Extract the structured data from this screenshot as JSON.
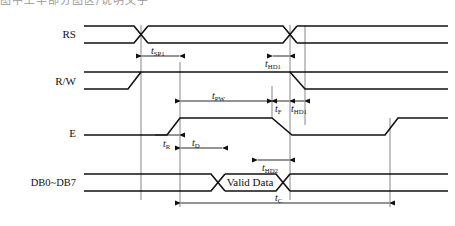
{
  "figure": {
    "title_cut_off": "图中上半部分图区/说明文字",
    "kind": "timing-diagram",
    "background_color": "#ffffff",
    "line_color": "#111111",
    "reference_line_color": "#555555"
  },
  "signals": [
    {
      "id": "rs",
      "label": "RS",
      "row_index": 0
    },
    {
      "id": "rw",
      "label": "R/W",
      "row_index": 1
    },
    {
      "id": "e",
      "label": "E",
      "row_index": 2
    },
    {
      "id": "db",
      "label": "DB0~DB7",
      "row_index": 3
    }
  ],
  "data_bus": {
    "valid_label": "Valid Data"
  },
  "timings": [
    {
      "id": "tsp1",
      "base": "t",
      "sub": "SP1",
      "row": "rs",
      "note": "setup time before E rise"
    },
    {
      "id": "thd1_rs",
      "base": "t",
      "sub": "HD1",
      "row": "rs",
      "note": "hold time after E fall"
    },
    {
      "id": "tpw",
      "base": "t",
      "sub": "PW",
      "row": "rw",
      "note": "E pulse width"
    },
    {
      "id": "tf",
      "base": "t",
      "sub": "F",
      "row": "rw",
      "note": "E fall time"
    },
    {
      "id": "thd1_rw",
      "base": "t",
      "sub": "HD1",
      "row": "rw",
      "note": "hold time after E fall"
    },
    {
      "id": "tr",
      "base": "t",
      "sub": "R",
      "row": "e",
      "note": "E rise time"
    },
    {
      "id": "td",
      "base": "t",
      "sub": "D",
      "row": "e",
      "note": "data delay time"
    },
    {
      "id": "thd2",
      "base": "t",
      "sub": "HD2",
      "row": "db",
      "note": "data hold time"
    },
    {
      "id": "tc",
      "base": "t",
      "sub": "C",
      "row": "db",
      "note": "enable cycle time"
    }
  ]
}
